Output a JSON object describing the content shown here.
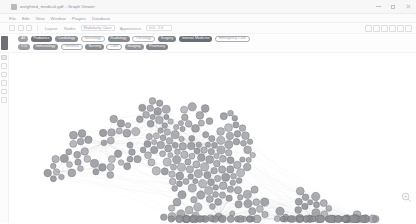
{
  "window": {
    "title": "weighted_medical.gdf - Graph Viewer",
    "app_icon": "app-window-icon",
    "controls": [
      {
        "name": "minimize-button",
        "glyph": "minimize-icon"
      },
      {
        "name": "maximize-button",
        "glyph": "maximize-icon"
      },
      {
        "name": "close-button",
        "glyph": "close-icon"
      }
    ]
  },
  "menubar": {
    "items": [
      {
        "label": "File",
        "name": "menu-file"
      },
      {
        "label": "Edit",
        "name": "menu-edit"
      },
      {
        "label": "View",
        "name": "menu-view"
      },
      {
        "label": "Window",
        "name": "menu-window"
      },
      {
        "label": "Plugins",
        "name": "menu-plugins"
      },
      {
        "label": "Database",
        "name": "menu-database"
      }
    ]
  },
  "toolbar": {
    "left_icons": [
      {
        "name": "new-graph-icon"
      },
      {
        "name": "open-file-icon"
      },
      {
        "name": "save-icon"
      }
    ],
    "label_layout": "Layout",
    "label_nodes": "Nodes",
    "field_filter_value": "Modularity Class",
    "label_appearance": "Appearance",
    "field_range_value": "0.0 - 1.0",
    "right_icons": [
      {
        "name": "zoom-fit-icon"
      },
      {
        "name": "select-tool-icon"
      },
      {
        "name": "drag-tool-icon"
      },
      {
        "name": "brush-tool-icon"
      },
      {
        "name": "label-tool-icon"
      },
      {
        "name": "settings-gear-icon"
      }
    ]
  },
  "chips": {
    "collapse_button": "chip-rail-collapse",
    "row1": [
      {
        "label": "All",
        "color": "#9ea0a6",
        "outline": false
      },
      {
        "label": "Pediatrics",
        "color": "#6f7278",
        "outline": false
      },
      {
        "label": "Cardiology",
        "color": "#8b8e94",
        "outline": false
      },
      {
        "label": "Neurology",
        "color": "#b7b9bd",
        "outline": true
      },
      {
        "label": "Radiology",
        "color": "#85888e",
        "outline": false
      },
      {
        "label": "Oncology",
        "color": "#b4b6ba",
        "outline": true
      },
      {
        "label": "Surgery",
        "color": "#7d8086",
        "outline": false
      },
      {
        "label": "Internal Medicine",
        "color": "#6a6d73",
        "outline": false
      },
      {
        "label": "Emergency Care",
        "color": "#a9abb0",
        "outline": true
      }
    ],
    "row2": [
      {
        "label": "ICU",
        "color": "#9b9da3",
        "outline": false
      },
      {
        "label": "Immunology",
        "color": "#8f9298",
        "outline": false
      },
      {
        "label": "Genetics",
        "color": "#a7a9ae",
        "outline": true
      },
      {
        "label": "Nursing",
        "color": "#898c92",
        "outline": false
      },
      {
        "label": "Labs",
        "color": "#a2a4a9",
        "outline": true
      },
      {
        "label": "Imaging",
        "color": "#93969c",
        "outline": false
      },
      {
        "label": "Pharmacy",
        "color": "#83868c",
        "outline": false
      }
    ]
  },
  "left_rail": {
    "items": [
      {
        "name": "rail-item-pointer-icon",
        "style": "dark"
      },
      {
        "name": "rail-item-hand-icon",
        "style": "normal"
      },
      {
        "name": "rail-item-lasso-icon",
        "style": "normal"
      },
      {
        "name": "rail-item-brush-icon",
        "style": "normal"
      },
      {
        "name": "rail-item-node-icon",
        "style": "normal"
      },
      {
        "name": "rail-item-edge-icon",
        "style": "normal"
      }
    ]
  },
  "canvas": {
    "name": "network-graph-canvas",
    "node_fill": "#8e9096",
    "node_stroke": "#6b6d73",
    "edge_color": "#c9cace",
    "background": "#ffffff"
  },
  "zoom_controls": [
    {
      "name": "zoom-in-button",
      "glyph": "magnifier-plus-icon"
    },
    {
      "name": "zoom-out-button",
      "glyph": "magnifier-minus-icon"
    }
  ],
  "chart_data": {
    "type": "scatter",
    "node_count": 287,
    "clusters": [
      {
        "name": "upper-left-cluster",
        "cx": 95,
        "cy": 95,
        "rx": 38,
        "ry": 30,
        "count": 34
      },
      {
        "name": "central-dense-core",
        "cx": 190,
        "cy": 95,
        "rx": 52,
        "ry": 42,
        "count": 108
      },
      {
        "name": "mid-lower-cluster",
        "cx": 205,
        "cy": 160,
        "rx": 50,
        "ry": 32,
        "count": 62
      },
      {
        "name": "right-hub-cluster",
        "cx": 300,
        "cy": 170,
        "rx": 32,
        "ry": 26,
        "count": 38
      },
      {
        "name": "right-tail-cluster",
        "cx": 345,
        "cy": 185,
        "rx": 22,
        "ry": 20,
        "count": 24
      },
      {
        "name": "left-satellite",
        "cx": 52,
        "cy": 118,
        "rx": 14,
        "ry": 12,
        "count": 9
      },
      {
        "name": "top-satellite",
        "cx": 150,
        "cy": 58,
        "rx": 16,
        "ry": 8,
        "count": 12
      }
    ]
  }
}
